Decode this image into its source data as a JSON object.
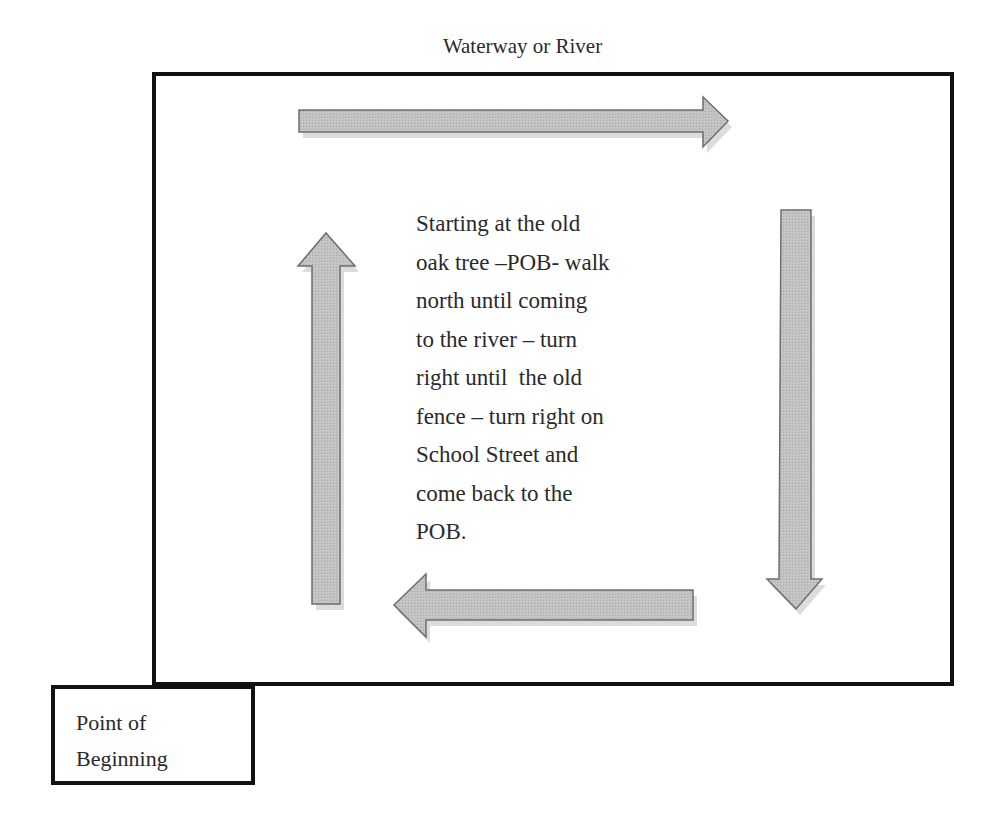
{
  "diagram": {
    "type": "property-boundary-walk",
    "top_label": "Waterway or River",
    "description_lines": [
      "Starting at the old",
      "oak tree –POB- walk",
      "north until coming",
      "to the river – turn",
      "right until  the old",
      "fence – turn right on",
      "School Street and",
      "come back to the",
      "POB."
    ],
    "pob_box": {
      "lines": [
        "Point of",
        "Beginning"
      ]
    },
    "arrows": [
      {
        "id": "north",
        "direction": "up",
        "position": "left"
      },
      {
        "id": "east",
        "direction": "right",
        "position": "top"
      },
      {
        "id": "south",
        "direction": "down",
        "position": "right"
      },
      {
        "id": "west",
        "direction": "left",
        "position": "bottom"
      }
    ],
    "colors": {
      "arrow_fill": "#bdbdbd",
      "arrow_stroke": "#6e6e6e",
      "arrow_shadow": "#d9d9d9",
      "frame": "#111111",
      "text": "#2a2a2a"
    }
  }
}
